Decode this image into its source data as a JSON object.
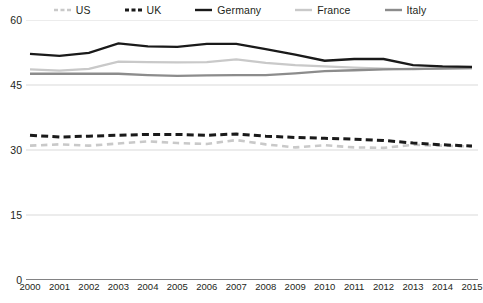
{
  "chart_data": {
    "type": "line",
    "title": "",
    "subtitle": "",
    "xlabel": "",
    "ylabel": "",
    "x": [
      2000,
      2001,
      2002,
      2003,
      2004,
      2005,
      2006,
      2007,
      2008,
      2009,
      2010,
      2011,
      2012,
      2013,
      2014,
      2015
    ],
    "categories": [
      "2000",
      "2001",
      "2002",
      "2003",
      "2004",
      "2005",
      "2006",
      "2007",
      "2008",
      "2009",
      "2010",
      "2011",
      "2012",
      "2013",
      "2014",
      "2015"
    ],
    "ylim": [
      0,
      60
    ],
    "yticks": [
      0,
      15,
      30,
      45,
      60
    ],
    "ytick_labels": [
      "0",
      "15",
      "30",
      "45",
      "60"
    ],
    "grid": true,
    "legend_position": "top",
    "series": [
      {
        "name": "US",
        "color": "#c9c9c9",
        "style": "dashed",
        "width": 2.6,
        "values": [
          31.0,
          31.3,
          31.0,
          31.5,
          32.0,
          31.6,
          31.4,
          32.3,
          31.3,
          30.6,
          31.1,
          30.6,
          30.5,
          31.2,
          31.0,
          30.8
        ]
      },
      {
        "name": "UK",
        "color": "#1a1a1a",
        "style": "dashed",
        "width": 3.0,
        "values": [
          33.4,
          33.0,
          33.2,
          33.4,
          33.6,
          33.6,
          33.4,
          33.7,
          33.2,
          32.9,
          32.7,
          32.5,
          32.2,
          31.6,
          31.2,
          30.9
        ]
      },
      {
        "name": "Germany",
        "color": "#1a1a1a",
        "style": "solid",
        "width": 2.3,
        "values": [
          52.2,
          51.7,
          52.4,
          54.6,
          53.9,
          53.8,
          54.5,
          54.5,
          53.3,
          52.0,
          50.6,
          51.0,
          51.0,
          49.6,
          49.3,
          49.2
        ]
      },
      {
        "name": "France",
        "color": "#c9c9c9",
        "style": "solid",
        "width": 2.3,
        "values": [
          48.6,
          48.3,
          48.7,
          50.4,
          50.3,
          50.2,
          50.3,
          50.9,
          50.1,
          49.6,
          49.3,
          49.0,
          48.8,
          48.6,
          48.9,
          48.9
        ]
      },
      {
        "name": "Italy",
        "color": "#8c8c8c",
        "style": "solid",
        "width": 2.3,
        "values": [
          47.6,
          47.6,
          47.6,
          47.6,
          47.3,
          47.1,
          47.2,
          47.3,
          47.3,
          47.7,
          48.2,
          48.4,
          48.6,
          48.7,
          48.8,
          48.9
        ]
      }
    ]
  },
  "legend": {
    "items": [
      {
        "label": "US",
        "color": "#c9c9c9",
        "style": "dashed"
      },
      {
        "label": "UK",
        "color": "#1a1a1a",
        "style": "dashed"
      },
      {
        "label": "Germany",
        "color": "#1a1a1a",
        "style": "solid"
      },
      {
        "label": "France",
        "color": "#c9c9c9",
        "style": "solid"
      },
      {
        "label": "Italy",
        "color": "#8c8c8c",
        "style": "solid"
      }
    ]
  },
  "axes": {
    "y_labels": [
      "60",
      "45",
      "30",
      "15",
      "0"
    ],
    "x_labels": [
      "2000",
      "2001",
      "2002",
      "2003",
      "2004",
      "2005",
      "2006",
      "2007",
      "2008",
      "2009",
      "2010",
      "2011",
      "2012",
      "2013",
      "2014",
      "2015"
    ],
    "gridline_color": "#d9d9d9",
    "baseline_color": "#58595b"
  }
}
